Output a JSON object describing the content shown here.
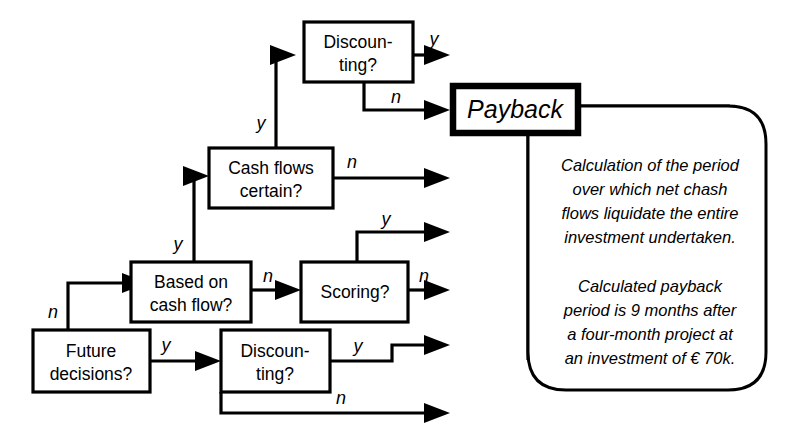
{
  "diagram": {
    "background_color": "#ffffff",
    "line_color": "#000000",
    "nodes": [
      {
        "id": "discounting_top",
        "line1": "Discoun-",
        "line2": "ting?"
      },
      {
        "id": "cash_flows_certain",
        "line1": "Cash flows",
        "line2": "certain?"
      },
      {
        "id": "based_on_cash_flow",
        "line1": "Based on",
        "line2": "cash flow?"
      },
      {
        "id": "scoring",
        "line1": "Scoring?",
        "line2": ""
      },
      {
        "id": "future_decisions",
        "line1": "Future",
        "line2": "decisions?"
      },
      {
        "id": "discounting_bottom",
        "line1": "Discoun-",
        "line2": "ting?"
      }
    ],
    "result": {
      "id": "payback",
      "label": "Payback"
    },
    "edge_labels": [
      {
        "id": "discounting-top-yes",
        "text": "y"
      },
      {
        "id": "discounting-top-no",
        "text": "n"
      },
      {
        "id": "cash-flows-certain-yes",
        "text": "y"
      },
      {
        "id": "cash-flows-certain-no",
        "text": "n"
      },
      {
        "id": "based-on-cash-flow-yes",
        "text": "y"
      },
      {
        "id": "based-on-cash-flow-no",
        "text": "n"
      },
      {
        "id": "scoring-yes",
        "text": "y"
      },
      {
        "id": "scoring-no",
        "text": "n"
      },
      {
        "id": "future-decisions-no",
        "text": "n"
      },
      {
        "id": "future-decisions-yes",
        "text": "y"
      },
      {
        "id": "discounting-bottom-yes",
        "text": "y"
      },
      {
        "id": "discounting-bottom-no",
        "text": "n"
      }
    ],
    "callout": {
      "paragraph1": [
        "Calculation of the period",
        "over which net chash",
        "flows liquidate the entire",
        "investment undertaken."
      ],
      "paragraph2": [
        "Calculated payback",
        "period is 9 months after",
        "a four-month project at",
        "an investment of € 70k."
      ]
    }
  }
}
